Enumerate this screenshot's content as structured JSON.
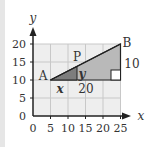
{
  "diagram": {
    "type": "coordinate-geometry",
    "axes": {
      "x_label": "x",
      "y_label": "y",
      "x_ticks": [
        "0",
        "5",
        "10",
        "15",
        "20",
        "25"
      ],
      "y_ticks": [
        "0",
        "5",
        "10",
        "15",
        "20"
      ]
    },
    "points": {
      "A": {
        "label": "A",
        "x": 5,
        "y": 10
      },
      "B": {
        "label": "B",
        "x": 25,
        "y": 20
      },
      "P": {
        "label": "P",
        "x": 12.5,
        "y": 13.75
      }
    },
    "labels": {
      "x_segment": "x",
      "y_segment": "y",
      "base_length": "20",
      "height_length": "10"
    },
    "colors": {
      "grid_bg": "#eeeeee",
      "grid_line": "#c8c8c8",
      "large_triangle": "#b9b9b9",
      "small_triangle": "#7d7d7d",
      "axis": "#222222"
    }
  }
}
